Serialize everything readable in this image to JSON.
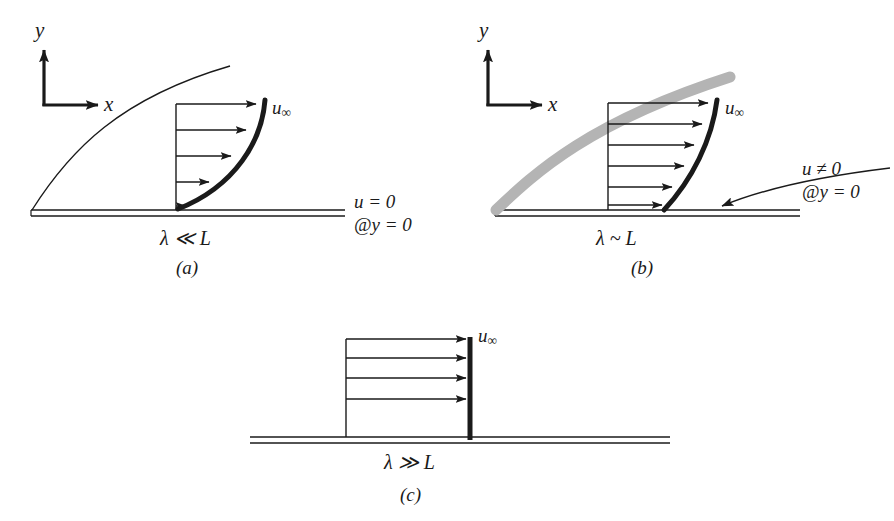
{
  "figure": {
    "background": "#ffffff",
    "ink": "#1a1a1a",
    "shade": "#b4b4b4",
    "panels": [
      {
        "id": "a",
        "caption": "(a)",
        "axes": {
          "y_label": "y",
          "x_label": "x"
        },
        "freestream_label": "u",
        "freestream_sub": "∞",
        "scale_label": "λ ≪ L",
        "boundary_condition": {
          "line1": "u = 0",
          "line2": "@y = 0"
        },
        "arrow_count": 5,
        "boundary_layer_style": "thin-line",
        "profile_type": "no-slip-parabolic"
      },
      {
        "id": "b",
        "caption": "(b)",
        "axes": {
          "y_label": "y",
          "x_label": "x"
        },
        "freestream_label": "u",
        "freestream_sub": "∞",
        "scale_label": "λ ~ L",
        "boundary_condition": {
          "line1": "u ≠ 0",
          "line2": "@y = 0"
        },
        "arrow_count": 6,
        "boundary_layer_style": "gray-band",
        "profile_type": "slip-at-wall"
      },
      {
        "id": "c",
        "caption": "(c)",
        "axes": null,
        "freestream_label": "u",
        "freestream_sub": "∞",
        "scale_label": "λ ≫ L",
        "boundary_condition": null,
        "arrow_count": 5,
        "boundary_layer_style": "none",
        "profile_type": "uniform-plug"
      }
    ]
  }
}
